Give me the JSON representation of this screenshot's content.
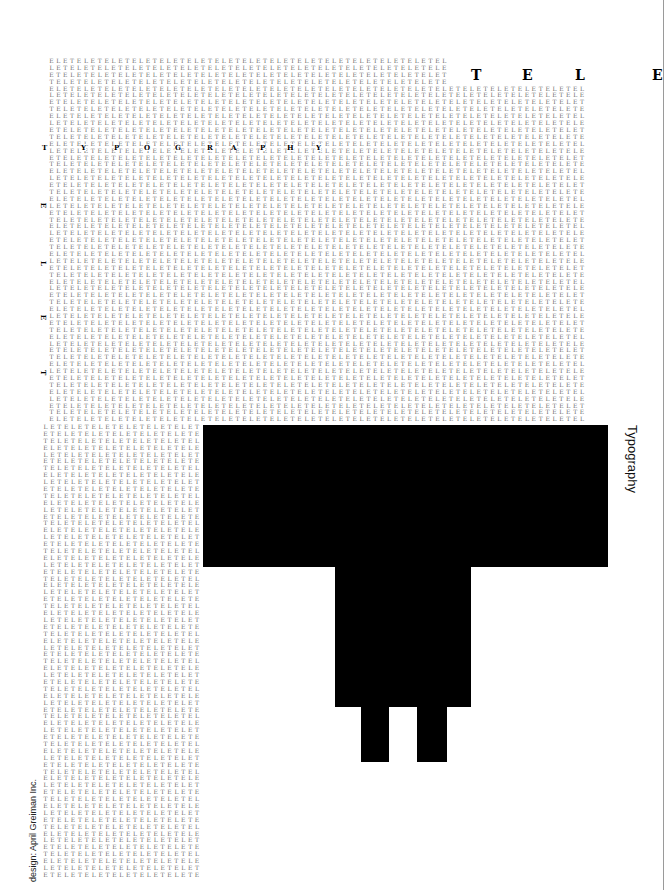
{
  "poster": {
    "pattern": "ELET",
    "header_letters": [
      {
        "char": "T",
        "x": 471,
        "y": 68
      },
      {
        "char": "E",
        "x": 522,
        "y": 68
      },
      {
        "char": "L",
        "x": 575,
        "y": 68
      },
      {
        "char": "E",
        "x": 652,
        "y": 68
      }
    ],
    "inline_word": {
      "row_y": 144,
      "letters": [
        {
          "char": "T",
          "x": 42
        },
        {
          "char": "Y",
          "x": 81
        },
        {
          "char": "P",
          "x": 114
        },
        {
          "char": "O",
          "x": 144
        },
        {
          "char": "G",
          "x": 175
        },
        {
          "char": "R",
          "x": 207
        },
        {
          "char": "A",
          "x": 231
        },
        {
          "char": "P",
          "x": 260
        },
        {
          "char": "H",
          "x": 287
        },
        {
          "char": "Y",
          "x": 316
        }
      ]
    },
    "margin_letters": [
      {
        "char": "E",
        "x": 41,
        "y": 202
      },
      {
        "char": "L",
        "x": 41,
        "y": 260
      },
      {
        "char": "E",
        "x": 41,
        "y": 314
      },
      {
        "char": "T",
        "x": 41,
        "y": 369
      }
    ],
    "side_label": "Typography",
    "credit": "design: April Greiman Inc.",
    "grids": [
      {
        "name": "top-narrow",
        "x": 48,
        "y": 58,
        "rows": 4,
        "cols": 58,
        "offset": 0
      },
      {
        "name": "main-wide",
        "x": 48,
        "y": 85.6,
        "rows": 49,
        "cols": 78,
        "offset": 4
      },
      {
        "name": "left-column",
        "x": 42,
        "y": 424,
        "rows": 66,
        "cols": 23,
        "offset": 1
      }
    ],
    "shape_color": "#000000",
    "grid_color": "#6a6a6a"
  }
}
